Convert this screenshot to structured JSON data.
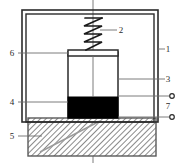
{
  "figure": {
    "type": "technical-cross-section",
    "background_color": "#ffffff",
    "line_color": "#2b2b2b",
    "fill_black": "#000000",
    "hatch_color": "#8a8a8a"
  },
  "callouts": [
    {
      "id": "callout-1",
      "label": "1",
      "x": 168,
      "y": 49,
      "target": "outer-housing-wall",
      "leader": "short-left"
    },
    {
      "id": "callout-2",
      "label": "2",
      "x": 121,
      "y": 30,
      "target": "spring",
      "leader": "left-to-spring"
    },
    {
      "id": "callout-3",
      "label": "3",
      "x": 168,
      "y": 79,
      "target": "cylinder-right-wall",
      "leader": "long-left"
    },
    {
      "id": "callout-4",
      "label": "4",
      "x": 12,
      "y": 102,
      "target": "black-block",
      "leader": "right-to-block"
    },
    {
      "id": "callout-5",
      "label": "5",
      "x": 12,
      "y": 136,
      "target": "hatched-base",
      "leader": "right-to-base"
    },
    {
      "id": "callout-6",
      "label": "6",
      "x": 12,
      "y": 53,
      "target": "piston-cap",
      "leader": "right-to-cap"
    },
    {
      "id": "callout-7",
      "label": "7",
      "x": 168,
      "y": 105,
      "target": "terminal-pair",
      "leader": "none"
    }
  ],
  "terminals": [
    {
      "id": "terminal-upper",
      "cx": 172,
      "cy": 96
    },
    {
      "id": "terminal-lower",
      "cx": 172,
      "cy": 117
    }
  ],
  "components": {
    "outer_housing": {
      "x": 22,
      "y": 10,
      "width": 136,
      "height": 112
    },
    "inner_housing": {
      "x": 26,
      "y": 14,
      "width": 128,
      "height": 108
    },
    "cylinder": {
      "x": 68,
      "y": 52,
      "width": 50,
      "height": 66
    },
    "piston_cap": {
      "x": 68,
      "y": 50,
      "width": 50,
      "height": 6
    },
    "black_block": {
      "x": 68,
      "y": 97,
      "width": 50,
      "height": 21
    },
    "hatched_base": {
      "x": 28,
      "y": 118,
      "width": 128,
      "height": 38
    },
    "spring": {
      "cx": 93,
      "top": 18,
      "bottom": 50,
      "coils": 4,
      "width": 18
    },
    "center_line": {
      "x": 93,
      "top": 0,
      "bottom": 163
    }
  }
}
